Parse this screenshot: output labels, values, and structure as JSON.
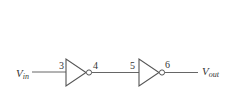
{
  "diagram": {
    "input": {
      "label": "V",
      "sub": "in"
    },
    "output": {
      "label": "V",
      "sub": "out"
    },
    "nodes": [
      {
        "id": "3",
        "label": "3"
      },
      {
        "id": "4",
        "label": "4"
      },
      {
        "id": "5",
        "label": "5"
      },
      {
        "id": "6",
        "label": "6"
      }
    ],
    "gates": [
      {
        "type": "inverter",
        "in_node": "3",
        "out_node": "4"
      },
      {
        "type": "inverter",
        "in_node": "5",
        "out_node": "6"
      }
    ],
    "colors": {
      "stroke": "#555555",
      "text": "#333333"
    }
  }
}
